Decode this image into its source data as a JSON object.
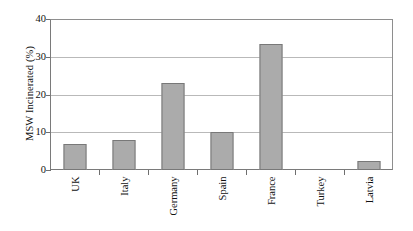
{
  "chart_data": {
    "type": "bar",
    "title": "",
    "xlabel": "",
    "ylabel": "MSW Incinerated (%)",
    "categories": [
      "UK",
      "Italy",
      "Germany",
      "Spain",
      "France",
      "Turkey",
      "Latvia"
    ],
    "values": [
      7,
      8,
      23,
      10,
      33.5,
      0,
      2.3
    ],
    "ylim": [
      0,
      40
    ],
    "yticks": [
      0,
      10,
      20,
      30,
      40
    ],
    "ytick_labels": [
      "0",
      "10",
      "20",
      "30",
      "40"
    ],
    "grid": true,
    "legend": false,
    "legend_position": "none",
    "bar_fill_color": "#ababab",
    "bar_edge_color": "#787878",
    "gridline_color": "#b9b9b9",
    "axis_color": "#7a7a7a",
    "background_color": "#ffffff"
  }
}
